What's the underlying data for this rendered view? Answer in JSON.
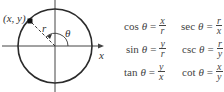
{
  "diagram": {
    "point_label": "(x, y)",
    "radius_label": "r",
    "angle_label": "θ",
    "x_axis_label": "x",
    "y_axis_label": "y",
    "colors": {
      "stroke": "#2b2b2b",
      "point": "#111111"
    }
  },
  "formulas": [
    {
      "fn": "cos",
      "var": "θ",
      "eq": "=",
      "num": "x",
      "den": "r"
    },
    {
      "fn": "sin",
      "var": "θ",
      "eq": "=",
      "num": "y",
      "den": "r"
    },
    {
      "fn": "tan",
      "var": "θ",
      "eq": "=",
      "num": "y",
      "den": "x"
    },
    {
      "fn": "sec",
      "var": "θ",
      "eq": "=",
      "num": "r",
      "den": "x"
    },
    {
      "fn": "csc",
      "var": "θ",
      "eq": "=",
      "num": "r",
      "den": "y"
    },
    {
      "fn": "cot",
      "var": "θ",
      "eq": "=",
      "num": "x",
      "den": "y"
    }
  ]
}
